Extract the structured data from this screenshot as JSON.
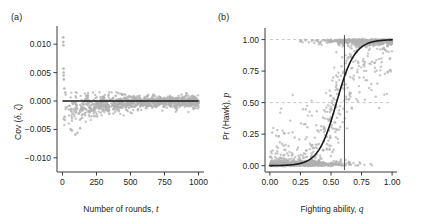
{
  "figure": {
    "background": "#ffffff",
    "point_color": "#b0b0b0",
    "line_color": "#1a1a1a",
    "axis_color": "#3a3a3a",
    "dashed_color": "#c9c9c9"
  },
  "panels": [
    {
      "label": "(a)",
      "name": "panel-a"
    },
    {
      "label": "(b)",
      "name": "panel-b"
    }
  ],
  "chart_data": [
    {
      "type": "scatter",
      "panel": "(a)",
      "title": "",
      "xlabel": "Number of rounds, t",
      "xlabel_text": "Number of rounds,",
      "xlabel_italic": "t",
      "ylabel": "Cov (δ, ζ)",
      "ylabel_text": "Cov (",
      "ylabel_italic_1": "δ",
      "ylabel_sep": ", ",
      "ylabel_italic_2": "ζ",
      "ylabel_end": ")",
      "xlim": [
        -40,
        1040
      ],
      "ylim": [
        -0.0125,
        0.0125
      ],
      "xticks": [
        0,
        250,
        500,
        750,
        1000
      ],
      "xticklabels": [
        "0",
        "250",
        "500",
        "750",
        "1000"
      ],
      "yticks": [
        0.01,
        0.005,
        0.0,
        -0.005,
        -0.01
      ],
      "yticklabels": [
        "0.010",
        "0.005",
        "0.000",
        "−0.005",
        "−0.010"
      ],
      "grid": false,
      "legend": "none",
      "reference_lines": [
        {
          "orientation": "horizontal",
          "value": 0.0,
          "style": "solid",
          "color": "#1a1a1a"
        }
      ],
      "description": "Funnel-shaped cloud of grey points converging to zero covariance as number of rounds increases; most points lie below zero at small t, with a few large positive outliers near t=0.",
      "series": [
        {
          "name": "Cov(delta, zeta) replicates",
          "marker": "circle",
          "color": "#b0b0b0",
          "n_points": 1100,
          "outliers": [
            {
              "x": 6,
              "y": 0.0112
            },
            {
              "x": 6,
              "y": 0.0104
            },
            {
              "x": 7,
              "y": 0.0098
            },
            {
              "x": 8,
              "y": 0.0057
            },
            {
              "x": 9,
              "y": 0.005
            },
            {
              "x": 9,
              "y": 0.0045
            },
            {
              "x": 10,
              "y": 0.0038
            },
            {
              "x": 14,
              "y": 0.0022
            },
            {
              "x": 20,
              "y": 0.0015
            },
            {
              "x": 175,
              "y": 0.0009
            },
            {
              "x": 300,
              "y": 0.0008
            },
            {
              "x": 70,
              "y": -0.0052
            },
            {
              "x": 95,
              "y": -0.0059
            },
            {
              "x": 110,
              "y": -0.0056
            },
            {
              "x": 60,
              "y": -0.005
            },
            {
              "x": 130,
              "y": -0.0048
            }
          ],
          "envelope_note": "Spread half-width decays roughly as 0.0030*exp(-x/260)+0.00045; mean offset roughly -0.0016*exp(-x/230)"
        }
      ]
    },
    {
      "type": "scatter",
      "panel": "(b)",
      "title": "",
      "xlabel": "Fighting ability, q",
      "xlabel_text": "Fighting ability,",
      "xlabel_italic": "q",
      "ylabel": "Pr (Hawk), p",
      "ylabel_text": "Pr (Hawk),",
      "ylabel_italic": "p",
      "xlim": [
        -0.04,
        1.04
      ],
      "ylim": [
        -0.05,
        1.06
      ],
      "xticks": [
        0.0,
        0.25,
        0.5,
        0.75,
        1.0
      ],
      "xticklabels": [
        "0.00",
        "0.25",
        "0.50",
        "0.75",
        "1.00"
      ],
      "yticks": [
        0.0,
        0.25,
        0.5,
        0.75,
        1.0
      ],
      "yticklabels": [
        "0.00",
        "0.25",
        "0.50",
        "0.75",
        "1.00"
      ],
      "grid": false,
      "legend": "none",
      "reference_lines": [
        {
          "orientation": "horizontal",
          "value": 1.0,
          "style": "dashed",
          "color": "#c9c9c9"
        },
        {
          "orientation": "horizontal",
          "value": 0.5,
          "style": "dashed",
          "color": "#c9c9c9"
        },
        {
          "orientation": "vertical",
          "value": 0.61,
          "style": "solid",
          "color": "#4a4a4a"
        }
      ],
      "description": "Grey points of realised Hawk probability against fighting ability, dense along p=0 for low q and p=1 for high q, overlaid by a black fitted logistic curve; a vertical line marks the switch point q=0.61.",
      "fitted_curve": {
        "name": "logistic fit",
        "color": "#1a1a1a",
        "form": "p = 1 / (1 + exp(-k*(q - q0)))",
        "k": 13.5,
        "q0": 0.545,
        "points": [
          {
            "q": 0.0,
            "p": 0.001
          },
          {
            "q": 0.1,
            "p": 0.003
          },
          {
            "q": 0.2,
            "p": 0.011
          },
          {
            "q": 0.25,
            "p": 0.02
          },
          {
            "q": 0.3,
            "p": 0.039
          },
          {
            "q": 0.35,
            "p": 0.073
          },
          {
            "q": 0.4,
            "p": 0.133
          },
          {
            "q": 0.45,
            "p": 0.23
          },
          {
            "q": 0.5,
            "p": 0.366
          },
          {
            "q": 0.545,
            "p": 0.5
          },
          {
            "q": 0.6,
            "p": 0.647
          },
          {
            "q": 0.65,
            "p": 0.761
          },
          {
            "q": 0.7,
            "p": 0.849
          },
          {
            "q": 0.75,
            "p": 0.908
          },
          {
            "q": 0.8,
            "p": 0.946
          },
          {
            "q": 0.85,
            "p": 0.969
          },
          {
            "q": 0.9,
            "p": 0.983
          },
          {
            "q": 0.95,
            "p": 0.991
          },
          {
            "q": 1.0,
            "p": 0.995
          }
        ]
      },
      "series": [
        {
          "name": "simulated individuals",
          "marker": "circle",
          "color": "#b0b0b0",
          "n_points": 1400
        }
      ]
    }
  ]
}
